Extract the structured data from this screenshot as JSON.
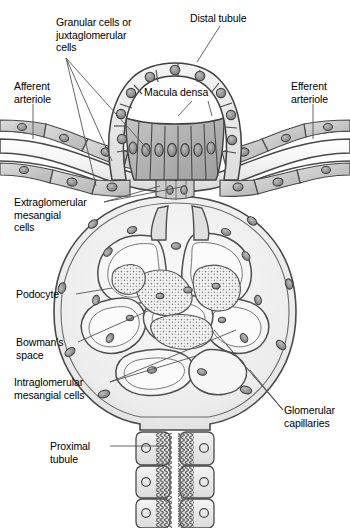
{
  "figure": {
    "type": "anatomical-diagram",
    "style": "grayscale line drawing",
    "colors": {
      "outline": "#3a3a3a",
      "cell_fill_light": "#e8e8e8",
      "cell_fill_mid": "#c9c9c9",
      "cell_fill_dark": "#a8a8a8",
      "nucleus": "#9a9a9a",
      "nucleus_dark": "#6e6e6e",
      "bowman_space": "#eeeeee",
      "mesangial_stipple": "#f2f2f2",
      "background": "#ffffff",
      "leader_line": "#555555",
      "text": "#000000"
    }
  },
  "labels": {
    "granular_cells": "Granular cells or\njuxtaglomerular\ncells",
    "distal_tubule": "Distal tubule",
    "macula_densa": "Macula densa",
    "afferent_arteriole": "Afferent\narteriole",
    "efferent_arteriole": "Efferent\narteriole",
    "extraglomerular_mesangial": "Extraglomerular\nmesangial\ncells",
    "podocyte": "Podocyte",
    "bowmans_space": "Bowman's\nspace",
    "intraglomerular_mesangial": "Intraglomerular\nmesangial cells",
    "glomerular_capillaries": "Glomerular\ncapillaries",
    "proximal_tubule": "Proximal\ntubule"
  },
  "structures": [
    {
      "name": "distal-tubule",
      "description": "arched row of cuboidal epithelial cells forming top arc"
    },
    {
      "name": "macula_densa",
      "description": "tall columnar darker cells at base of distal tubule arch"
    },
    {
      "name": "afferent-arteriole",
      "description": "vessel entering from left with endothelial and granular cells"
    },
    {
      "name": "efferent-arteriole",
      "description": "vessel exiting to right"
    },
    {
      "name": "granular-cells",
      "description": "juxtaglomerular granular cells in arteriole walls"
    },
    {
      "name": "extraglomerular-mesangial-cells",
      "description": "cells in the angle between arterioles below macula densa"
    },
    {
      "name": "glomerular-capillaries",
      "description": "convoluted capillary loops inside Bowman's capsule"
    },
    {
      "name": "podocyte",
      "description": "visceral epithelial cells wrapping capillary loops"
    },
    {
      "name": "bowmans-space",
      "description": "light gray space between capsule wall and capillary tuft"
    },
    {
      "name": "intraglomerular-mesangial-cells",
      "description": "stippled regions between capillary loops"
    },
    {
      "name": "proximal-tubule",
      "description": "three tiers of cells with microvilli brush border below capsule"
    }
  ]
}
